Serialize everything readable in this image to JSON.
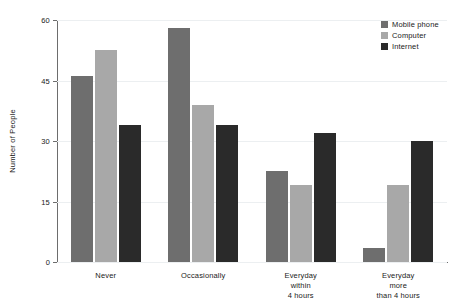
{
  "chart_data": {
    "type": "bar",
    "title": "",
    "xlabel": "",
    "ylabel": "Number of People",
    "categories": [
      "Never",
      "Occasionally",
      "Everyday within\n4 hours",
      "Everyday more\nthan 4 hours"
    ],
    "series": [
      {
        "name": "Mobile phone",
        "color": "#6e6e6e",
        "values": [
          46,
          58,
          22.5,
          3.5
        ]
      },
      {
        "name": "Computer",
        "color": "#a8a8a8",
        "values": [
          52.5,
          39,
          19,
          19
        ]
      },
      {
        "name": "Internet",
        "color": "#2a2a2a",
        "values": [
          34,
          34,
          32,
          30
        ]
      }
    ],
    "ylim": [
      0,
      60
    ],
    "yticks": [
      0,
      15,
      30,
      45,
      60
    ],
    "ytick_labels": [
      "0",
      "15",
      "30",
      "45",
      "60"
    ],
    "grid": true,
    "legend_position": "top-right"
  }
}
